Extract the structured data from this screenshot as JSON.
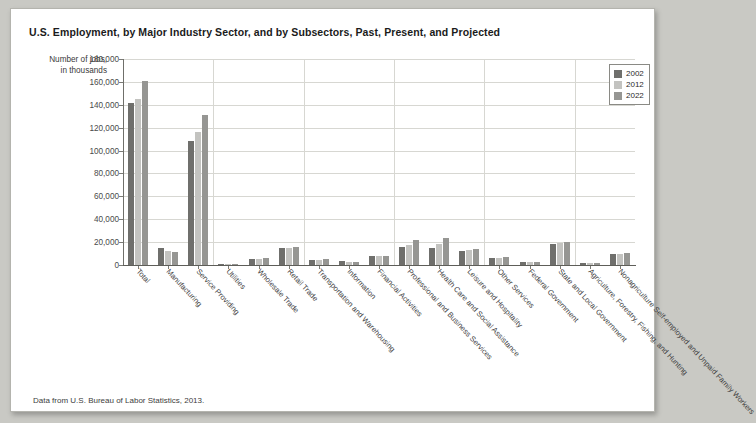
{
  "title": "U.S. Employment, by Major Industry Sector, and by Subsectors, Past, Present, and Projected",
  "axis_label_line1": "Number of jobs,",
  "axis_label_line2": "in thousands",
  "footnote": "Data from U.S. Bureau of Labor Statistics, 2013.",
  "legend": {
    "items": [
      {
        "label": "2002",
        "color": "#6f6f6c"
      },
      {
        "label": "2012",
        "color": "#c3c3c0"
      },
      {
        "label": "2022",
        "color": "#969693"
      }
    ]
  },
  "chart_data": {
    "type": "bar",
    "title": "U.S. Employment, by Major Industry Sector, and by Subsectors, Past, Present, and Projected",
    "xlabel": "",
    "ylabel": "Number of jobs, in thousands",
    "ylim": [
      0,
      180000
    ],
    "yticks": [
      0,
      20000,
      40000,
      60000,
      80000,
      100000,
      120000,
      140000,
      160000,
      180000
    ],
    "ytick_labels": [
      "0",
      "20,000",
      "40,000",
      "60,000",
      "80,000",
      "100,000",
      "120,000",
      "140,000",
      "160,000",
      "180,000"
    ],
    "grid": true,
    "legend_position": "top-right",
    "categories": [
      "Total",
      "Manufacturing",
      "Service Providing",
      "Utilities",
      "Wholesale Trade",
      "Retail Trade",
      "Transportation and Warehousing",
      "Information",
      "Financial Activities",
      "Professional and Business Services",
      "Health Care and Social Assistance",
      "Leisure and Hospitality",
      "Other Services",
      "Federal Government",
      "State and Local Government",
      "Agriculture, Forestry, Fishing, and Hunting",
      "Nonagriculture Self-employed and Unpaid Family Workers"
    ],
    "series": [
      {
        "name": "2002",
        "color": "#6f6f6c",
        "values": [
          142000,
          15300,
          108000,
          600,
          5650,
          15000,
          4250,
          3400,
          7850,
          16000,
          14800,
          11900,
          6200,
          2700,
          18800,
          2150,
          9300
        ]
      },
      {
        "name": "2012",
        "color": "#c3c3c0",
        "values": [
          145000,
          11900,
          116000,
          550,
          5650,
          14900,
          4400,
          2700,
          7800,
          17500,
          18000,
          13100,
          6400,
          2800,
          19200,
          2100,
          9300
        ]
      },
      {
        "name": "2022",
        "color": "#969693",
        "values": [
          161000,
          11400,
          131000,
          530,
          6000,
          15600,
          4900,
          2600,
          8300,
          21500,
          23900,
          14400,
          7100,
          2400,
          20500,
          1900,
          10200
        ]
      }
    ]
  }
}
